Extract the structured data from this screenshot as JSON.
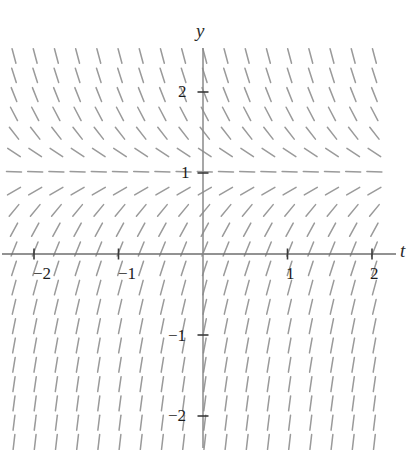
{
  "figure": {
    "width": 415,
    "height": 450
  },
  "axes": {
    "x_label": "t",
    "y_label": "y",
    "origin_px": {
      "x": 203,
      "y": 254
    },
    "unit_px": {
      "x": 84.5,
      "y": 81
    },
    "x_axis_color": "#6e6e6e",
    "y_axis_color": "#8a8a8a",
    "x_ticks": [
      {
        "value": -2,
        "label": "−2",
        "x_px": 33,
        "y_px": 264
      },
      {
        "value": -1,
        "label": "−1",
        "x_px": 118,
        "y_px": 264
      },
      {
        "value": 1,
        "label": "1",
        "x_px": 286,
        "y_px": 264
      },
      {
        "value": 2,
        "label": "2",
        "x_px": 370,
        "y_px": 264
      }
    ],
    "y_ticks": [
      {
        "value": 2,
        "label": "2",
        "x_px": 178,
        "y_px": 82
      },
      {
        "value": 1,
        "label": "1",
        "x_px": 181,
        "y_px": 163
      },
      {
        "value": -1,
        "label": "−1",
        "x_px": 168,
        "y_px": 326
      },
      {
        "value": -2,
        "label": "−2",
        "x_px": 168,
        "y_px": 406
      }
    ]
  },
  "chart_data": {
    "type": "line",
    "subtype": "slope-field",
    "title": "",
    "xlabel": "t",
    "ylabel": "y",
    "xlim": [
      -2.4,
      2.25
    ],
    "ylim": [
      -2.5,
      2.45
    ],
    "grid": false,
    "legend": null,
    "equilibrium_lines": [
      {
        "y": 1,
        "slope": 0,
        "description": "horizontal segments along y = 1"
      }
    ],
    "slope_rule": "dy/dt proportional to (1 - y) with magnitude growing away from y = 1; segments tilt down-right above y = 1 and up-right below y = 1",
    "tick_color": "#7d7d7d",
    "tick_length_px": 11,
    "sample_slopes": [
      {
        "t": -2,
        "y": 2.25,
        "direction": "steep down-right"
      },
      {
        "t": 0,
        "y": 2.25,
        "direction": "steep down-right"
      },
      {
        "t": 2,
        "y": 2.25,
        "direction": "steep down-right"
      },
      {
        "t": -2,
        "y": 1,
        "direction": "horizontal"
      },
      {
        "t": 0,
        "y": 1,
        "direction": "horizontal"
      },
      {
        "t": 2,
        "y": 1,
        "direction": "horizontal"
      },
      {
        "t": -2,
        "y": 0,
        "direction": "shallow up-right"
      },
      {
        "t": 0,
        "y": 0,
        "direction": "shallow up-right"
      },
      {
        "t": 2,
        "y": 0,
        "direction": "shallow up-right"
      },
      {
        "t": -2,
        "y": -2,
        "direction": "steep, near vertical"
      },
      {
        "t": 0,
        "y": -2,
        "direction": "steep, near vertical"
      },
      {
        "t": 2,
        "y": -2,
        "direction": "steep, near vertical"
      }
    ],
    "grid_spacing_px": {
      "x": 21.2,
      "y": 19.3
    },
    "segment_length_px": 15,
    "segment_color": "#9a9a9a",
    "plot_area_px": {
      "left": 14,
      "top": 56,
      "right": 394,
      "bottom": 444
    }
  }
}
